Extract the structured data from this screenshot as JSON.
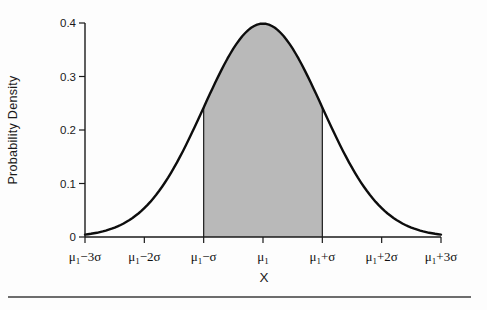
{
  "figure": {
    "y_axis_title": "Probability Density",
    "x_axis_title": "X"
  },
  "chart_data": {
    "type": "area",
    "title": "",
    "xlabel": "X",
    "ylabel": "Probability Density",
    "ylim": [
      0,
      0.4
    ],
    "y_ticks": [
      "0",
      "0.1",
      "0.2",
      "0.3",
      "0.4"
    ],
    "y_tick_values": [
      0,
      0.1,
      0.2,
      0.3,
      0.4
    ],
    "sigma_range": [
      -3,
      3
    ],
    "x_ticks": [
      {
        "z": -3,
        "pre": "μ",
        "sub": "1",
        "post": "−3σ"
      },
      {
        "z": -2,
        "pre": "μ",
        "sub": "1",
        "post": "−2σ"
      },
      {
        "z": -1,
        "pre": "μ",
        "sub": "1",
        "post": "−σ"
      },
      {
        "z": 0,
        "pre": "μ",
        "sub": "1",
        "post": ""
      },
      {
        "z": 1,
        "pre": "μ",
        "sub": "1",
        "post": "+σ"
      },
      {
        "z": 2,
        "pre": "μ",
        "sub": "1",
        "post": "+2σ"
      },
      {
        "z": 3,
        "pre": "μ",
        "sub": "1",
        "post": "+3σ"
      }
    ],
    "curve_points": [
      {
        "z": -3.0,
        "density": 0.004
      },
      {
        "z": -2.5,
        "density": 0.018
      },
      {
        "z": -2.0,
        "density": 0.054
      },
      {
        "z": -1.5,
        "density": 0.13
      },
      {
        "z": -1.0,
        "density": 0.242
      },
      {
        "z": -0.5,
        "density": 0.352
      },
      {
        "z": 0.0,
        "density": 0.399
      },
      {
        "z": 0.5,
        "density": 0.352
      },
      {
        "z": 1.0,
        "density": 0.242
      },
      {
        "z": 1.5,
        "density": 0.13
      },
      {
        "z": 2.0,
        "density": 0.054
      },
      {
        "z": 2.5,
        "density": 0.018
      },
      {
        "z": 3.0,
        "density": 0.004
      }
    ],
    "peak_density": 0.399,
    "shaded_region": {
      "from_z": -1,
      "to_z": 1,
      "fill": "#b9b9b9"
    },
    "colors": {
      "curve": "#0d0d0d",
      "axis": "#1a1a1a",
      "fill": "#b9b9b9",
      "background": "#fdfdfd"
    },
    "grid": false,
    "legend": false
  }
}
